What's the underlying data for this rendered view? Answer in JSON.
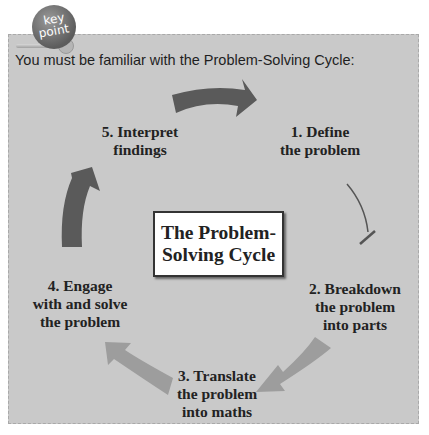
{
  "badge": {
    "line1": "key",
    "line2": "point"
  },
  "intro": "You must be familiar with the Problem-Solving Cycle:",
  "center": {
    "line1": "The Problem-",
    "line2": "Solving Cycle"
  },
  "steps": [
    {
      "lines": [
        "1. Define",
        "the problem"
      ]
    },
    {
      "lines": [
        "2. Breakdown",
        "the problem",
        "into parts"
      ]
    },
    {
      "lines": [
        "3. Translate",
        "the problem",
        "into maths"
      ]
    },
    {
      "lines": [
        "4. Engage",
        "with and solve",
        "the problem"
      ]
    },
    {
      "lines": [
        "5. Interpret",
        "findings"
      ]
    }
  ],
  "colors": {
    "panel": "#c9c9c9",
    "dark_arrow": "#5a5a5a",
    "light_arrow": "#9d9d9d",
    "text": "#222222"
  }
}
